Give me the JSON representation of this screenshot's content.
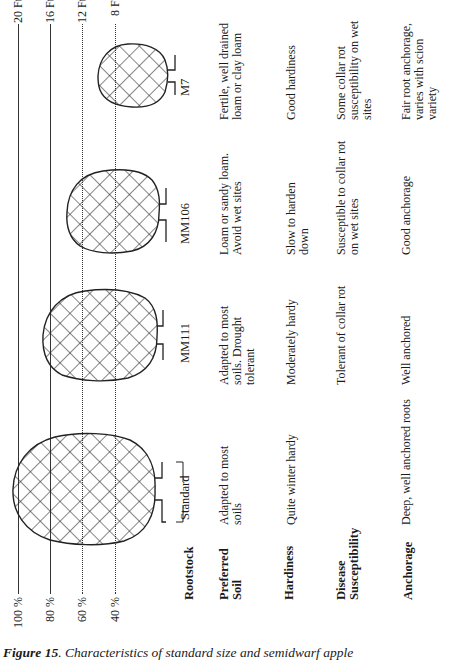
{
  "scale": {
    "percent_labels": [
      "100 %",
      "80 %",
      "60 %",
      "40 %"
    ],
    "height_labels": [
      "20 Ft.",
      "16 Ft.",
      "12 Ft.",
      "8 Ft."
    ]
  },
  "rootstocks": [
    {
      "name": "Standard",
      "relative_size": "100 %",
      "height": "20 Ft.",
      "preferred_soil": "Adapted to most soils",
      "hardiness": "Quite winter hardy",
      "disease_susceptibility": "",
      "anchorage": "Deep, well anchored roots"
    },
    {
      "name": "MM111",
      "relative_size": "80 %",
      "height": "16 Ft.",
      "preferred_soil": "Adapted to most soils. Drought tolerant",
      "hardiness": "Moderately hardy",
      "disease_susceptibility": "Tolerant of collar rot",
      "anchorage": "Well anchored"
    },
    {
      "name": "MM106",
      "relative_size": "60 %",
      "height": "12 Ft.",
      "preferred_soil": "Loam or sandy loam. Avoid wet sites",
      "hardiness": "Slow to harden down",
      "disease_susceptibility": "Susceptible to collar rot on wet sites",
      "anchorage": "Good anchorage"
    },
    {
      "name": "M7",
      "relative_size": "40 %",
      "height": "8 Ft.",
      "preferred_soil": "Fertile, well drained loam or clay loam",
      "hardiness": "Good hardiness",
      "disease_susceptibility": "Some collar rot susceptibility on wet sites",
      "anchorage": "Fair root anchorage, varies with scion variety"
    }
  ],
  "row_labels": {
    "rootstock": "Rootstock",
    "preferred_soil_1": "Preferred",
    "preferred_soil_2": "Soil",
    "hardiness": "Hardiness",
    "disease_1": "Disease",
    "disease_2": "Susceptibility",
    "anchorage": "Anchorage"
  },
  "caption": {
    "figure_number": "Figure 15",
    "text": ". Characteristics of standard size and semidwarf apple"
  },
  "colors": {
    "ink": "#1a1a1a",
    "background": "#ffffff"
  }
}
